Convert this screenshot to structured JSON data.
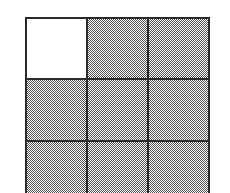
{
  "figure": {
    "type": "grid-diagram",
    "rows": 3,
    "columns": 3,
    "colors": {
      "background": "#ffffff",
      "grid_line": "#2b2b2b",
      "shaded_fill": "#808080",
      "shaded_dither_ink": "#545454",
      "unshaded_fill": "#ffffff"
    },
    "geometry": {
      "canvas_width": 230,
      "canvas_height": 193,
      "grid_left": 25,
      "grid_top": 17,
      "grid_width": 185,
      "grid_line_thickness": 2,
      "bottom_row_cropped": true
    },
    "shading_style": "dithered 50% gray checkerboard halftone",
    "cells": [
      {
        "id": "r1c1",
        "row": 1,
        "column": 1,
        "state": "unshaded",
        "label": ""
      },
      {
        "id": "r1c2",
        "row": 1,
        "column": 2,
        "state": "shaded",
        "label": ""
      },
      {
        "id": "r1c3",
        "row": 1,
        "column": 3,
        "state": "shaded",
        "label": ""
      },
      {
        "id": "r2c1",
        "row": 2,
        "column": 1,
        "state": "shaded",
        "label": ""
      },
      {
        "id": "r2c2",
        "row": 2,
        "column": 2,
        "state": "shaded",
        "label": ""
      },
      {
        "id": "r2c3",
        "row": 2,
        "column": 3,
        "state": "shaded",
        "label": ""
      },
      {
        "id": "r3c1",
        "row": 3,
        "column": 1,
        "state": "shaded",
        "label": ""
      },
      {
        "id": "r3c2",
        "row": 3,
        "column": 2,
        "state": "shaded",
        "label": ""
      },
      {
        "id": "r3c3",
        "row": 3,
        "column": 3,
        "state": "shaded",
        "label": ""
      }
    ],
    "counts": {
      "total_cells": 9,
      "shaded_cells": 8,
      "unshaded_cells": 1
    }
  }
}
